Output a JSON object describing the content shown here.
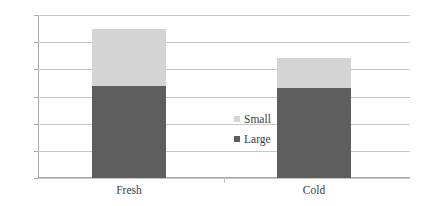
{
  "chart_data": {
    "type": "bar",
    "subtype": "stacked",
    "title": "",
    "xlabel": "",
    "ylabel": "",
    "categories": [
      "Fresh",
      "Cold"
    ],
    "series": [
      {
        "name": "Large",
        "values": [
          34,
          33
        ],
        "color": "#5e5e5e"
      },
      {
        "name": "Small",
        "values": [
          21,
          11
        ],
        "color": "#d4d4d4"
      }
    ],
    "totals": [
      55,
      44
    ],
    "ylim": [
      0,
      60
    ],
    "ytick_step": 10,
    "yticks": [
      0,
      10,
      20,
      30,
      40,
      50,
      60
    ],
    "ytick_labels": [
      "0",
      "10",
      "20",
      "30",
      "40",
      "50",
      "60"
    ],
    "grid": true,
    "grid_axis": "y",
    "legend_position": "inside-center-right",
    "legend_entries": [
      "Small",
      "Large"
    ]
  },
  "colors": {
    "small": "#d4d4d4",
    "large": "#5e5e5e",
    "gridline": "#c8c8c8",
    "axis": "#a9a9a9",
    "text": "#3d3d3d",
    "background": "#ffffff"
  }
}
